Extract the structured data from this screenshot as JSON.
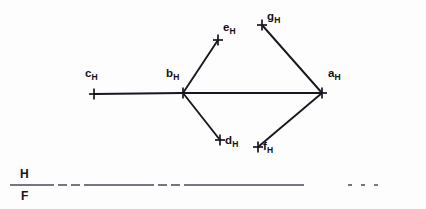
{
  "figure": {
    "background_color": "#fdfdfd",
    "ink_color": "#1a1620",
    "fold_line_color": "#4a4a5a",
    "width": 426,
    "height": 209
  },
  "points": [
    {
      "id": "c",
      "label": "c",
      "subscript": "H",
      "x": 94,
      "y": 94,
      "label_x": 85,
      "label_y": 68,
      "tick": "plus"
    },
    {
      "id": "b",
      "label": "b",
      "subscript": "H",
      "x": 183,
      "y": 93,
      "label_x": 166,
      "label_y": 68,
      "tick": "plus"
    },
    {
      "id": "e",
      "label": "e",
      "subscript": "H",
      "x": 218,
      "y": 40,
      "label_x": 223,
      "label_y": 22,
      "tick": "plus"
    },
    {
      "id": "g",
      "label": "g",
      "subscript": "H",
      "x": 262,
      "y": 25,
      "label_x": 267,
      "label_y": 11,
      "tick": "plus"
    },
    {
      "id": "d",
      "label": "d",
      "subscript": "H",
      "x": 220,
      "y": 140,
      "label_x": 225,
      "label_y": 135,
      "tick": "plus"
    },
    {
      "id": "f",
      "label": "f",
      "subscript": "H",
      "x": 258,
      "y": 147,
      "label_x": 263,
      "label_y": 141,
      "tick": "plus"
    },
    {
      "id": "a",
      "label": "a",
      "subscript": "H",
      "x": 322,
      "y": 93,
      "label_x": 328,
      "label_y": 68,
      "tick": "plus"
    }
  ],
  "segments": [
    {
      "id": "c-b",
      "from": "c",
      "to": "b",
      "style": "solid"
    },
    {
      "id": "b-a",
      "from": "b",
      "to": "a",
      "style": "solid"
    },
    {
      "id": "b-e",
      "from": "b",
      "to": "e",
      "style": "solid"
    },
    {
      "id": "b-d",
      "from": "b",
      "to": "d",
      "style": "solid"
    },
    {
      "id": "g-a",
      "from": "g",
      "to": "a",
      "style": "solid"
    },
    {
      "id": "f-a",
      "from": "f",
      "to": "a",
      "style": "solid"
    }
  ],
  "fold_line": {
    "id": "hf-reference-line",
    "upper_label": "H",
    "lower_label": "F",
    "x_start": 10,
    "x_end": 400,
    "y": 185,
    "upper_label_x": 20,
    "upper_label_y": 168,
    "lower_label_x": 21,
    "lower_label_y": 190,
    "dash_pattern": "44 4 9 4 9 4 70 4 9 4 9 4 120"
  }
}
